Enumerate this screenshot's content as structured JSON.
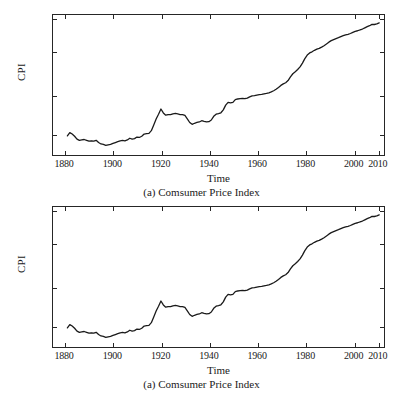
{
  "document": {
    "cut_title_fragment": "· ·",
    "font_style": "serif"
  },
  "figures": [
    {
      "caption": "(a) Comsumer Price Index",
      "xlabel": "Time",
      "ylabel": "CPI"
    },
    {
      "caption": "(a) Comsumer Price Index",
      "xlabel": "Time",
      "ylabel": "CPI"
    }
  ],
  "chart_data": [
    {
      "type": "line",
      "title": "",
      "caption": "(a) Comsumer Price Index",
      "xlabel": "Time",
      "ylabel": "CPI",
      "yscale": "log",
      "xscale": "linear",
      "grid": false,
      "legend": null,
      "xlim": [
        1875,
        2013
      ],
      "ylim": [
        5.5,
        280
      ],
      "xticks": [
        1880,
        1900,
        1920,
        1940,
        1960,
        1980,
        2000,
        2010
      ],
      "xticklabels": [
        "1880",
        "1900",
        "1920",
        "1940",
        "1960",
        "1980",
        "2000",
        "2010"
      ],
      "yticks": [
        10,
        30,
        100,
        250
      ],
      "yticklabels": [
        "10",
        "30",
        "100",
        "250"
      ],
      "line_color": "#1a1a1a",
      "line_width": 1.3,
      "series": [
        {
          "name": "CPI",
          "x": [
            1881,
            1882,
            1883,
            1884,
            1885,
            1886,
            1887,
            1888,
            1889,
            1890,
            1891,
            1892,
            1893,
            1894,
            1895,
            1896,
            1897,
            1898,
            1899,
            1900,
            1901,
            1902,
            1903,
            1904,
            1905,
            1906,
            1907,
            1908,
            1909,
            1910,
            1911,
            1912,
            1913,
            1914,
            1915,
            1916,
            1917,
            1918,
            1919,
            1920,
            1921,
            1922,
            1923,
            1924,
            1925,
            1926,
            1927,
            1928,
            1929,
            1930,
            1931,
            1932,
            1933,
            1934,
            1935,
            1936,
            1937,
            1938,
            1939,
            1940,
            1941,
            1942,
            1943,
            1944,
            1945,
            1946,
            1947,
            1948,
            1949,
            1950,
            1951,
            1952,
            1953,
            1954,
            1955,
            1956,
            1957,
            1958,
            1959,
            1960,
            1961,
            1962,
            1963,
            1964,
            1965,
            1966,
            1967,
            1968,
            1969,
            1970,
            1971,
            1972,
            1973,
            1974,
            1975,
            1976,
            1977,
            1978,
            1979,
            1980,
            1981,
            1982,
            1983,
            1984,
            1985,
            1986,
            1987,
            1988,
            1989,
            1990,
            1991,
            1992,
            1993,
            1994,
            1995,
            1996,
            1997,
            1998,
            1999,
            2000,
            2001,
            2002,
            2003,
            2004,
            2005,
            2006,
            2007,
            2008,
            2009,
            2010,
            2011
          ],
          "values": [
            9.4,
            10.3,
            9.9,
            9.3,
            8.6,
            8.3,
            8.4,
            8.5,
            8.3,
            8.1,
            8.2,
            8.1,
            8.3,
            7.8,
            7.5,
            7.4,
            7.2,
            7.3,
            7.4,
            7.6,
            7.8,
            8.0,
            8.2,
            8.3,
            8.2,
            8.4,
            8.8,
            8.6,
            8.7,
            9.1,
            9.0,
            9.3,
            9.9,
            10.0,
            10.1,
            10.9,
            12.8,
            15.1,
            17.3,
            20.0,
            17.9,
            16.8,
            17.1,
            17.1,
            17.5,
            17.7,
            17.4,
            17.1,
            17.1,
            16.7,
            15.2,
            13.7,
            13.0,
            13.4,
            13.7,
            13.9,
            14.4,
            14.1,
            13.9,
            14.0,
            14.7,
            16.3,
            17.3,
            17.6,
            18.0,
            19.5,
            22.3,
            24.1,
            23.8,
            24.1,
            26.0,
            26.5,
            26.7,
            26.9,
            26.8,
            27.2,
            28.1,
            28.9,
            29.1,
            29.6,
            29.9,
            30.2,
            30.6,
            31.0,
            31.5,
            32.4,
            33.4,
            34.8,
            36.7,
            38.8,
            40.5,
            41.8,
            44.4,
            49.3,
            53.8,
            56.9,
            60.6,
            65.2,
            72.6,
            82.4,
            90.9,
            96.5,
            99.6,
            103.9,
            107.6,
            109.6,
            113.6,
            118.3,
            124.0,
            130.7,
            136.2,
            140.3,
            144.5,
            148.2,
            152.4,
            156.9,
            160.5,
            163.0,
            166.6,
            172.2,
            177.1,
            179.9,
            184.0,
            188.9,
            195.3,
            201.6,
            207.3,
            215.3,
            214.5,
            218.1,
            224.9
          ]
        }
      ]
    },
    {
      "type": "line",
      "title": "",
      "caption": "(a) Comsumer Price Index",
      "xlabel": "Time",
      "ylabel": "CPI",
      "yscale": "log",
      "xscale": "linear",
      "grid": false,
      "legend": null,
      "xlim": [
        1875,
        2013
      ],
      "ylim": [
        5.5,
        280
      ],
      "xticks": [
        1880,
        1900,
        1920,
        1940,
        1960,
        1980,
        2000,
        2010
      ],
      "xticklabels": [
        "1880",
        "1900",
        "1920",
        "1940",
        "1960",
        "1980",
        "2000",
        "2010"
      ],
      "yticks": [
        10,
        30,
        100,
        250
      ],
      "yticklabels": [
        "10",
        "30",
        "100",
        "250"
      ],
      "line_color": "#1a1a1a",
      "line_width": 1.3,
      "series": [
        {
          "name": "CPI",
          "x": [
            1881,
            1882,
            1883,
            1884,
            1885,
            1886,
            1887,
            1888,
            1889,
            1890,
            1891,
            1892,
            1893,
            1894,
            1895,
            1896,
            1897,
            1898,
            1899,
            1900,
            1901,
            1902,
            1903,
            1904,
            1905,
            1906,
            1907,
            1908,
            1909,
            1910,
            1911,
            1912,
            1913,
            1914,
            1915,
            1916,
            1917,
            1918,
            1919,
            1920,
            1921,
            1922,
            1923,
            1924,
            1925,
            1926,
            1927,
            1928,
            1929,
            1930,
            1931,
            1932,
            1933,
            1934,
            1935,
            1936,
            1937,
            1938,
            1939,
            1940,
            1941,
            1942,
            1943,
            1944,
            1945,
            1946,
            1947,
            1948,
            1949,
            1950,
            1951,
            1952,
            1953,
            1954,
            1955,
            1956,
            1957,
            1958,
            1959,
            1960,
            1961,
            1962,
            1963,
            1964,
            1965,
            1966,
            1967,
            1968,
            1969,
            1970,
            1971,
            1972,
            1973,
            1974,
            1975,
            1976,
            1977,
            1978,
            1979,
            1980,
            1981,
            1982,
            1983,
            1984,
            1985,
            1986,
            1987,
            1988,
            1989,
            1990,
            1991,
            1992,
            1993,
            1994,
            1995,
            1996,
            1997,
            1998,
            1999,
            2000,
            2001,
            2002,
            2003,
            2004,
            2005,
            2006,
            2007,
            2008,
            2009,
            2010,
            2011
          ],
          "values": [
            9.4,
            10.3,
            9.9,
            9.3,
            8.6,
            8.3,
            8.4,
            8.5,
            8.3,
            8.1,
            8.2,
            8.1,
            8.3,
            7.8,
            7.5,
            7.4,
            7.2,
            7.3,
            7.4,
            7.6,
            7.8,
            8.0,
            8.2,
            8.3,
            8.2,
            8.4,
            8.8,
            8.6,
            8.7,
            9.1,
            9.0,
            9.3,
            9.9,
            10.0,
            10.1,
            10.9,
            12.8,
            15.1,
            17.3,
            20.0,
            17.9,
            16.8,
            17.1,
            17.1,
            17.5,
            17.7,
            17.4,
            17.1,
            17.1,
            16.7,
            15.2,
            13.7,
            13.0,
            13.4,
            13.7,
            13.9,
            14.4,
            14.1,
            13.9,
            14.0,
            14.7,
            16.3,
            17.3,
            17.6,
            18.0,
            19.5,
            22.3,
            24.1,
            23.8,
            24.1,
            26.0,
            26.5,
            26.7,
            26.9,
            26.8,
            27.2,
            28.1,
            28.9,
            29.1,
            29.6,
            29.9,
            30.2,
            30.6,
            31.0,
            31.5,
            32.4,
            33.4,
            34.8,
            36.7,
            38.8,
            40.5,
            41.8,
            44.4,
            49.3,
            53.8,
            56.9,
            60.6,
            65.2,
            72.6,
            82.4,
            90.9,
            96.5,
            99.6,
            103.9,
            107.6,
            109.6,
            113.6,
            118.3,
            124.0,
            130.7,
            136.2,
            140.3,
            144.5,
            148.2,
            152.4,
            156.9,
            160.5,
            163.0,
            166.6,
            172.2,
            177.1,
            179.9,
            184.0,
            188.9,
            195.3,
            201.6,
            207.3,
            215.3,
            214.5,
            218.1,
            224.9
          ]
        }
      ]
    }
  ]
}
